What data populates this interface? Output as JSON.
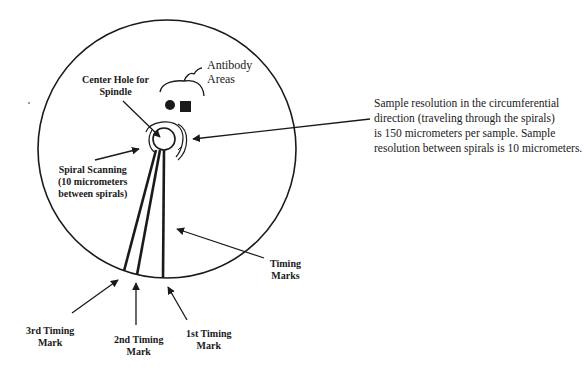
{
  "diagram": {
    "type": "disc-scan-layout",
    "colors": {
      "ink": "#1a1a1a",
      "background": "#ffffff"
    },
    "labels": {
      "antibody_areas": [
        "Antibody",
        "Areas"
      ],
      "center_hole": [
        "Center Hole for",
        "Spindle"
      ],
      "spiral_scanning": [
        "Spiral Scanning",
        "(10 micrometers",
        "between spirals)"
      ],
      "timing_marks": [
        "Timing",
        "Marks"
      ],
      "third_timing_mark": [
        "3rd  Timing",
        "Mark"
      ],
      "second_timing_mark": [
        "2nd Timing",
        "Mark"
      ],
      "first_timing_mark": [
        "1st Timing",
        "Mark"
      ]
    },
    "note": [
      "Sample resolution in the circumferential",
      "direction (traveling through the spirals)",
      "is 150 micrometers per sample.  Sample",
      "resolution between spirals is 10 micrometers."
    ],
    "shapes": {
      "disc": "large circle",
      "antibody_markers": [
        "filled-circle",
        "filled-square"
      ],
      "center_hole": "small circle",
      "timing_marks_count": 3
    }
  }
}
